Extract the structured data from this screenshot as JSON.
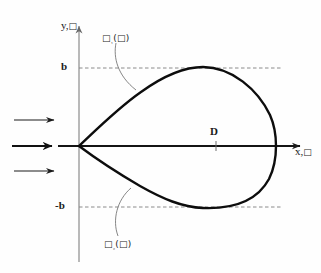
{
  "figure": {
    "type": "diagram",
    "width": 321,
    "height": 273,
    "background_color": "#fefefe"
  },
  "axes": {
    "x_label_main": "x,",
    "x_label_symbol": "□",
    "y_label_main": "y,",
    "y_label_symbol": "□",
    "axis_color": "#9a9a9a",
    "x_axis_color": "#1a1a1a",
    "origin_px": {
      "x": 79,
      "y": 146
    },
    "x_axis_end_px": 305,
    "y_axis_top_px": 18,
    "y_axis_bottom_px": 262
  },
  "ticks": [
    {
      "name": "b",
      "label": "b",
      "y_px": 68,
      "dashed": true
    },
    {
      "name": "-b",
      "label": "-b",
      "y_px": 207,
      "dashed": true
    }
  ],
  "region": {
    "label": "D",
    "marker_x_px": 216,
    "marker_y_px": 146
  },
  "curve_labels": [
    {
      "name": "upper-contour-label",
      "main": "□",
      "subscript": "₁",
      "argument": "(□)",
      "text": "□₁(□)",
      "position": "upper-left"
    },
    {
      "name": "lower-contour-label",
      "main": "□",
      "subscript": "₂",
      "argument": "(□)",
      "text": "□₂(□)",
      "position": "lower-left"
    }
  ],
  "flow_arrows": {
    "count": 3,
    "direction": "right",
    "color": "#1a1a1a",
    "items": [
      {
        "name": "flow-arrow-top",
        "y_px": 120,
        "x_start": 14,
        "x_end": 56,
        "weight": "thin"
      },
      {
        "name": "flow-arrow-middle",
        "y_px": 146,
        "x_start": 12,
        "x_end": 58,
        "weight": "thick"
      },
      {
        "name": "flow-arrow-bottom",
        "y_px": 171,
        "x_start": 14,
        "x_end": 56,
        "weight": "thin"
      }
    ]
  },
  "body_contour": {
    "name": "closed-teardrop-curve",
    "color": "#0d0d0d",
    "stroke_width": 2.4,
    "cusp_px": {
      "x": 79,
      "y": 146
    },
    "rightmost_px": {
      "x": 276,
      "y": 146
    },
    "top_px": {
      "x": 196,
      "y": 68
    },
    "bottom_px": {
      "x": 196,
      "y": 207
    }
  },
  "leaders": [
    {
      "name": "upper-leader-line",
      "from_px": {
        "x": 116,
        "y": 43
      },
      "to_px": {
        "x": 140,
        "y": 90
      }
    },
    {
      "name": "lower-leader-line",
      "from_px": {
        "x": 118,
        "y": 235
      },
      "to_px": {
        "x": 132,
        "y": 188
      }
    }
  ]
}
